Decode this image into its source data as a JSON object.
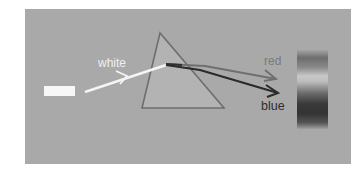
{
  "diagram": {
    "labels": {
      "incident": "white",
      "ray_top": "red",
      "ray_bottom": "blue"
    },
    "colors": {
      "background": "#ffffff",
      "panel": "#a9a9a9",
      "white_beam": "#f5f5f5",
      "prism_fill": "#b4b4b4",
      "prism_edge": "#6e6e6e",
      "red_ray": "#6f6f6f",
      "blue_ray": "#2a2a2a"
    },
    "elements": [
      {
        "name": "light-source",
        "shape": "rectangle"
      },
      {
        "name": "incident-beam",
        "label": "white"
      },
      {
        "name": "prism",
        "shape": "triangle"
      },
      {
        "name": "refracted-ray-red",
        "label": "red"
      },
      {
        "name": "refracted-ray-blue",
        "label": "blue"
      },
      {
        "name": "spectrum-screen",
        "shape": "gradient-band"
      }
    ]
  }
}
